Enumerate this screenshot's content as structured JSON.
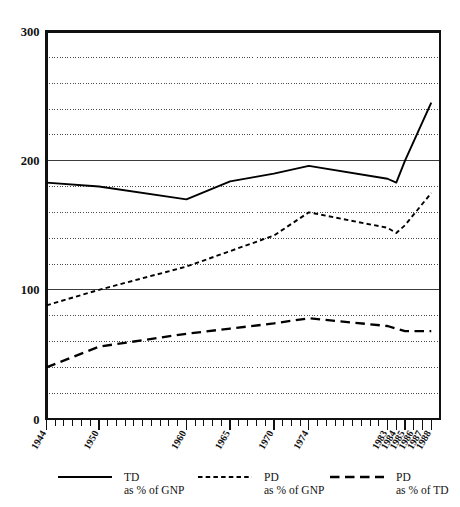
{
  "chart_data": {
    "type": "line",
    "title": "",
    "subtitle": "",
    "xlabel": "",
    "ylabel": "",
    "xlim": [
      1944,
      1989
    ],
    "ylim": [
      0,
      300
    ],
    "grid": true,
    "grid_interval": 20,
    "major_grid_values": [
      100,
      200,
      300
    ],
    "legend_position": "bottom",
    "y_ticks": [
      "0",
      "100",
      "200",
      "300"
    ],
    "y_tick_values": [
      0,
      100,
      200,
      300
    ],
    "x_ticks": [
      "1944",
      "1950",
      "1960",
      "1965",
      "1970",
      "1974",
      "1983",
      "1984",
      "1985",
      "1986",
      "1987",
      "1988"
    ],
    "x_tick_values": [
      1944,
      1950,
      1960,
      1965,
      1970,
      1974,
      1983,
      1984,
      1985,
      1986,
      1987,
      1988
    ],
    "series": [
      {
        "name": "TD",
        "sublabel": "as % of GNP",
        "style": "solid",
        "color": "#000000",
        "x": [
          1944,
          1950,
          1960,
          1965,
          1970,
          1974,
          1983,
          1984,
          1985,
          1988
        ],
        "values": [
          183,
          180,
          170,
          184,
          190,
          196,
          186,
          183,
          200,
          245
        ]
      },
      {
        "name": "PD",
        "sublabel": "as % of GNP",
        "style": "dotted-dash",
        "color": "#000000",
        "x": [
          1944,
          1950,
          1960,
          1965,
          1970,
          1974,
          1983,
          1984,
          1985,
          1988
        ],
        "values": [
          88,
          100,
          118,
          130,
          142,
          160,
          148,
          144,
          150,
          175
        ]
      },
      {
        "name": "PD",
        "sublabel": "as % of TD",
        "style": "long-dash",
        "color": "#000000",
        "x": [
          1944,
          1950,
          1960,
          1965,
          1970,
          1974,
          1983,
          1984,
          1985,
          1988
        ],
        "values": [
          40,
          56,
          66,
          70,
          74,
          78,
          72,
          70,
          68,
          68
        ]
      }
    ]
  },
  "legend": {
    "items": [
      {
        "name": "TD",
        "sublabel": "as % of GNP",
        "style": "solid"
      },
      {
        "name": "PD",
        "sublabel": "as % of GNP",
        "style": "dotted-dash"
      },
      {
        "name": "PD",
        "sublabel": "as % of TD",
        "style": "long-dash"
      }
    ]
  },
  "axes": {
    "y_axis_name": "value-axis",
    "x_axis_name": "year-axis"
  }
}
